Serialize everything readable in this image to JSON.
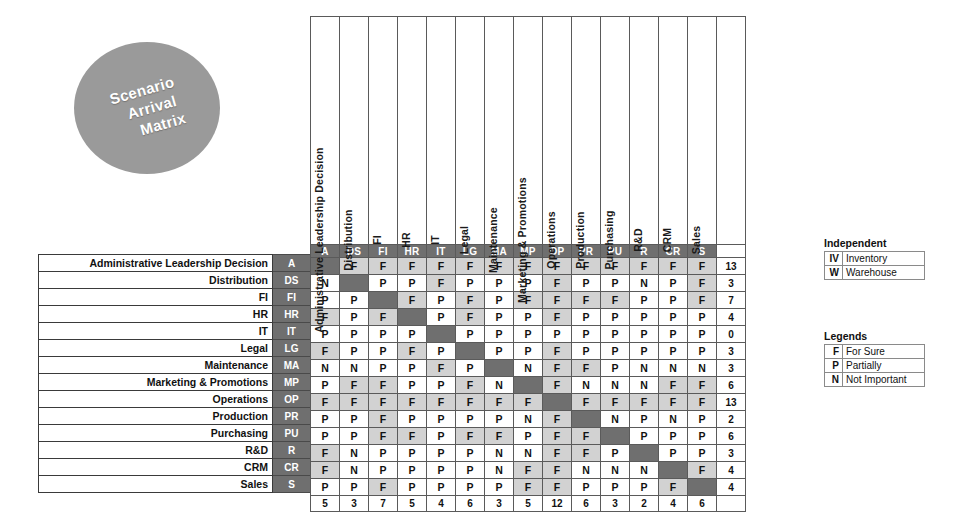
{
  "title": {
    "line1": "Scenario",
    "line2": "Arrival",
    "line3": "Matrix"
  },
  "matrix": {
    "columns": [
      {
        "code": "A",
        "name": "Administrative Leadership Decision"
      },
      {
        "code": "DS",
        "name": "Distribution"
      },
      {
        "code": "FI",
        "name": "FI"
      },
      {
        "code": "HR",
        "name": "HR"
      },
      {
        "code": "IT",
        "name": "IT"
      },
      {
        "code": "LG",
        "name": "Legal"
      },
      {
        "code": "MA",
        "name": "Maintenance"
      },
      {
        "code": "MP",
        "name": "Marketing & Promotions"
      },
      {
        "code": "OP",
        "name": "Operations"
      },
      {
        "code": "PR",
        "name": "Production"
      },
      {
        "code": "PU",
        "name": "Purchasing"
      },
      {
        "code": "R",
        "name": "R&D"
      },
      {
        "code": "CR",
        "name": "CRM"
      },
      {
        "code": "S",
        "name": "Sales"
      }
    ],
    "rows": [
      {
        "code": "A",
        "name": "Administrative Leadership Decision",
        "values": [
          "",
          "F",
          "F",
          "F",
          "F",
          "F",
          "F",
          "F",
          "F",
          "F",
          "F",
          "F",
          "F",
          "F"
        ],
        "total": "13"
      },
      {
        "code": "DS",
        "name": "Distribution",
        "values": [
          "N",
          "",
          "P",
          "P",
          "F",
          "P",
          "P",
          "P",
          "F",
          "P",
          "P",
          "N",
          "P",
          "F"
        ],
        "total": "3"
      },
      {
        "code": "FI",
        "name": "FI",
        "values": [
          "P",
          "P",
          "",
          "F",
          "P",
          "F",
          "P",
          "F",
          "F",
          "F",
          "F",
          "P",
          "P",
          "F"
        ],
        "total": "7"
      },
      {
        "code": "HR",
        "name": "HR",
        "values": [
          "F",
          "P",
          "F",
          "",
          "P",
          "F",
          "P",
          "P",
          "F",
          "P",
          "P",
          "P",
          "P",
          "P"
        ],
        "total": "4"
      },
      {
        "code": "IT",
        "name": "IT",
        "values": [
          "P",
          "P",
          "P",
          "P",
          "",
          "P",
          "P",
          "P",
          "P",
          "P",
          "P",
          "P",
          "P",
          "P"
        ],
        "total": "0"
      },
      {
        "code": "LG",
        "name": "Legal",
        "values": [
          "F",
          "P",
          "P",
          "F",
          "P",
          "",
          "P",
          "P",
          "F",
          "P",
          "P",
          "P",
          "P",
          "P"
        ],
        "total": "3"
      },
      {
        "code": "MA",
        "name": "Maintenance",
        "values": [
          "N",
          "N",
          "P",
          "P",
          "F",
          "P",
          "",
          "N",
          "F",
          "F",
          "P",
          "N",
          "N",
          "N"
        ],
        "total": "3"
      },
      {
        "code": "MP",
        "name": "Marketing & Promotions",
        "values": [
          "P",
          "F",
          "F",
          "P",
          "P",
          "F",
          "N",
          "",
          "F",
          "N",
          "N",
          "N",
          "F",
          "F"
        ],
        "total": "6"
      },
      {
        "code": "OP",
        "name": "Operations",
        "values": [
          "F",
          "F",
          "F",
          "F",
          "F",
          "F",
          "F",
          "F",
          "",
          "F",
          "F",
          "F",
          "F",
          "F"
        ],
        "total": "13"
      },
      {
        "code": "PR",
        "name": "Production",
        "values": [
          "P",
          "P",
          "F",
          "P",
          "P",
          "P",
          "P",
          "N",
          "F",
          "",
          "N",
          "P",
          "N",
          "P"
        ],
        "total": "2"
      },
      {
        "code": "PU",
        "name": "Purchasing",
        "values": [
          "P",
          "P",
          "F",
          "F",
          "P",
          "F",
          "F",
          "P",
          "F",
          "F",
          "",
          "P",
          "P",
          "P"
        ],
        "total": "6"
      },
      {
        "code": "R",
        "name": "R&D",
        "values": [
          "F",
          "N",
          "P",
          "P",
          "P",
          "P",
          "N",
          "N",
          "F",
          "F",
          "P",
          "",
          "P",
          "P"
        ],
        "total": "3"
      },
      {
        "code": "CR",
        "name": "CRM",
        "values": [
          "F",
          "N",
          "P",
          "P",
          "P",
          "P",
          "N",
          "F",
          "F",
          "N",
          "N",
          "N",
          "",
          "F"
        ],
        "total": "4"
      },
      {
        "code": "S",
        "name": "Sales",
        "values": [
          "P",
          "P",
          "F",
          "P",
          "P",
          "P",
          "P",
          "F",
          "F",
          "P",
          "P",
          "P",
          "F",
          ""
        ],
        "total": "4"
      }
    ],
    "column_sums": [
      "5",
      "3",
      "7",
      "5",
      "4",
      "6",
      "3",
      "5",
      "12",
      "6",
      "3",
      "2",
      "4",
      "6"
    ]
  },
  "independent": {
    "caption": "Independent",
    "items": [
      {
        "key": "IV",
        "label": "Inventory"
      },
      {
        "key": "W",
        "label": "Warehouse"
      }
    ]
  },
  "legends": {
    "caption": "Legends",
    "items": [
      {
        "key": "F",
        "label": "For Sure"
      },
      {
        "key": "P",
        "label": "Partially"
      },
      {
        "key": "N",
        "label": "Not Important"
      }
    ]
  },
  "colors": {
    "header_gray": "#6f6f6f",
    "cell_shade": "#d2d2d2",
    "circle_gray": "#9a9a9a"
  }
}
